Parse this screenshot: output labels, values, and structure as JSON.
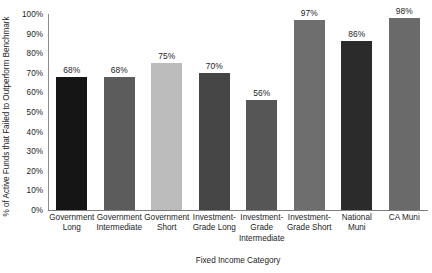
{
  "chart_data": {
    "type": "bar",
    "title": "",
    "xlabel": "Fixed Income Category",
    "ylabel": "% of Active Funds that Failed to Outperform Benchmark",
    "ylim": [
      0,
      100
    ],
    "grid": false,
    "legend": "none",
    "ytick_labels": [
      "100%",
      "90%",
      "80%",
      "70%",
      "60%",
      "50%",
      "40%",
      "30%",
      "20%",
      "10%",
      "0%"
    ],
    "ytick_values": [
      100,
      90,
      80,
      70,
      60,
      50,
      40,
      30,
      20,
      10,
      0
    ],
    "categories": [
      "Government Long",
      "Government Intermediate",
      "Government Short",
      "Investment-Grade Long",
      "Investment-Grade Intermediate",
      "Investment-Grade Short",
      "National Muni",
      "CA Muni"
    ],
    "category_lines": [
      [
        "Government",
        "Long"
      ],
      [
        "Government",
        "Intermediate"
      ],
      [
        "Government",
        "Short"
      ],
      [
        "Investment-",
        "Grade Long"
      ],
      [
        "Investment-",
        "Grade",
        "Intermediate"
      ],
      [
        "Investment-",
        "Grade Short"
      ],
      [
        "National",
        "Muni"
      ],
      [
        "CA Muni"
      ]
    ],
    "values": [
      68,
      68,
      75,
      70,
      56,
      97,
      86,
      98
    ],
    "value_labels": [
      "68%",
      "68%",
      "75%",
      "70%",
      "56%",
      "97%",
      "86%",
      "98%"
    ],
    "bar_colors": [
      "#151515",
      "#5c5c5c",
      "#bcbcbc",
      "#454545",
      "#565656",
      "#6e6e6e",
      "#2b2b2b",
      "#6a6a6a"
    ]
  },
  "axis_style": {
    "spine_color": "#7d7d7d"
  }
}
